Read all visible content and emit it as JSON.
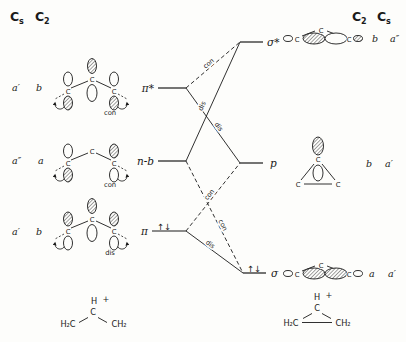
{
  "colors": {
    "ink": "#1a1a1a",
    "background": "#fdfdfb"
  },
  "headers": {
    "left": [
      {
        "base": "C",
        "sub": "s"
      },
      {
        "base": "C",
        "sub": "2"
      }
    ],
    "right": [
      {
        "base": "C",
        "sub": "2"
      },
      {
        "base": "C",
        "sub": "s"
      }
    ]
  },
  "left_levels": [
    {
      "label": "π*",
      "cs": "a′",
      "c2": "b",
      "mode": "con",
      "electrons": ""
    },
    {
      "label": "n-b",
      "cs": "a″",
      "c2": "a",
      "mode": "con",
      "electrons": ""
    },
    {
      "label": "π",
      "cs": "a′",
      "c2": "b",
      "mode": "dis",
      "electrons": "↑↓"
    }
  ],
  "right_levels": [
    {
      "label": "σ*",
      "c2": "b",
      "cs": "a″",
      "electrons": ""
    },
    {
      "label": "p",
      "c2": "b",
      "cs": "a′",
      "electrons": ""
    },
    {
      "label": "σ",
      "c2": "a",
      "cs": "a′",
      "electrons": "↑↓"
    }
  ],
  "correlations": [
    {
      "from": "π*",
      "to": "σ*",
      "mode": "con",
      "style": "dashed"
    },
    {
      "from": "n-b",
      "to": "σ*",
      "mode": "dis",
      "style": "solid"
    },
    {
      "from": "π*",
      "to": "p",
      "mode": "dis",
      "style": "solid"
    },
    {
      "from": "n-b",
      "to": "σ",
      "mode": "con",
      "style": "dashed"
    },
    {
      "from": "π",
      "to": "p",
      "mode": "con",
      "style": "dashed"
    },
    {
      "from": "π",
      "to": "σ",
      "mode": "dis",
      "style": "solid"
    }
  ],
  "atoms": {
    "carbon": "C"
  },
  "molecules": {
    "allyl_cation": {
      "h": "H",
      "charge": "+",
      "c": "C",
      "left_group": "H₂C",
      "right_group": "CH₂"
    },
    "cyclopropyl_cation": {
      "h": "H",
      "charge": "+",
      "c": "C",
      "left_group": "H₂C",
      "right_group": "CH₂"
    }
  }
}
